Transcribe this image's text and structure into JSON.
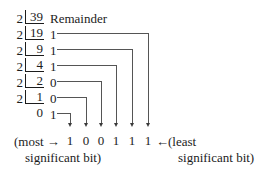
{
  "figure": {
    "kind": "binary-conversion-division-diagram",
    "header": {
      "remainder_label": "Remainder"
    },
    "divisor": "2",
    "rows": [
      {
        "divisor": "2",
        "dividend": "39",
        "remainder": ""
      },
      {
        "divisor": "2",
        "dividend": "19",
        "remainder": "1"
      },
      {
        "divisor": "2",
        "dividend": "9",
        "remainder": "1"
      },
      {
        "divisor": "2",
        "dividend": "4",
        "remainder": "1"
      },
      {
        "divisor": "2",
        "dividend": "2",
        "remainder": "0"
      },
      {
        "divisor": "2",
        "dividend": "1",
        "remainder": "0"
      },
      {
        "divisor": "",
        "dividend": "0",
        "remainder": "1"
      }
    ],
    "result_bits": [
      "1",
      "0",
      "0",
      "1",
      "1",
      "1"
    ],
    "left_caption": {
      "line1": "(most →",
      "line2": "significant bit)"
    },
    "right_caption": {
      "arrow": "←",
      "line1": "(least",
      "line2": "significant bit)"
    },
    "colors": {
      "text": "#1c1c1c",
      "line": "#555555",
      "arrow": "#3a3a3a",
      "background": "#ffffff"
    }
  }
}
